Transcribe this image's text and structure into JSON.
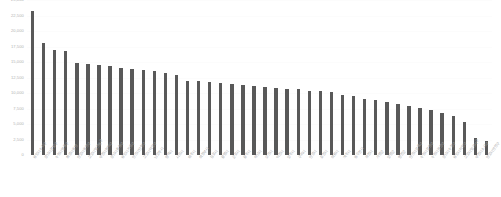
{
  "chart_data": {
    "type": "bar",
    "title": "",
    "subtitle": "",
    "xlabel": "",
    "ylabel": "",
    "ylim": [
      0,
      25000
    ],
    "grid": true,
    "legend": false,
    "legend_position": "none",
    "bar_color": "#595959",
    "axis_text_color": "#b3b3b3",
    "background_color": "#ffffff",
    "ytick_labels": [
      "25,000",
      "22,500",
      "20,000",
      "17,500",
      "15,000",
      "12,500",
      "10,000",
      "7,500",
      "5,000",
      "2,500",
      "0"
    ],
    "ytick_values": [
      25000,
      22500,
      20000,
      17500,
      15000,
      12500,
      10000,
      7500,
      5000,
      2500,
      0
    ],
    "categories": [
      "용인시 수지구",
      "성남시 분당구",
      "수원시 영통구",
      "화성시 동탄",
      "안양시 동안구",
      "고양시 일산동구",
      "부천시 원미구",
      "성남시 중원구",
      "용인시 기흥구",
      "안산시 단원구",
      "고양시 덕양구",
      "남양주시",
      "평택시",
      "시흥시",
      "파주시",
      "의정부시",
      "김포시",
      "광명시",
      "군포시",
      "광주시",
      "하남시",
      "오산시",
      "이천시",
      "양주시",
      "구리시",
      "안성시",
      "포천시",
      "의왕시",
      "여주시",
      "동두천시",
      "과천시",
      "가평군",
      "양평군",
      "연천군",
      "안산시 상록구",
      "수원시 장안구",
      "수원시 권선구",
      "성남시 수정구",
      "용인시 처인구",
      "고양시 일산서구",
      "부천시 소사구",
      "안양시 만안구"
    ],
    "values": [
      23200,
      18100,
      17000,
      16700,
      14900,
      14600,
      14500,
      14400,
      14100,
      13900,
      13700,
      13500,
      13200,
      12900,
      12000,
      11900,
      11700,
      11600,
      11400,
      11300,
      11100,
      11000,
      10800,
      10700,
      10600,
      10400,
      10300,
      10100,
      9700,
      9500,
      9100,
      8800,
      8500,
      8300,
      7900,
      7600,
      7200,
      6700,
      6300,
      5400,
      2700,
      2300
    ]
  }
}
